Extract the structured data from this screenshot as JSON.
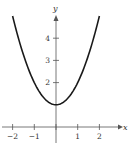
{
  "chart_data": {
    "type": "line",
    "title": "",
    "function": "y = x^2 + 1",
    "xlabel": "x",
    "ylabel": "y",
    "xlim": [
      -2.5,
      3.2
    ],
    "ylim": [
      -0.3,
      5.3
    ],
    "x_ticks": [
      -2,
      -1,
      0,
      1,
      2
    ],
    "x_tick_labels": [
      "−2",
      "−1",
      "",
      "1",
      "2"
    ],
    "y_ticks": [
      2,
      3,
      4
    ],
    "y_tick_labels": [
      "2",
      "3",
      "4"
    ],
    "grid": false,
    "legend": null,
    "series": [
      {
        "name": "y = x^2 + 1",
        "x": [
          -2,
          -1.5,
          -1,
          -0.5,
          0,
          0.5,
          1,
          1.5,
          2
        ],
        "values": [
          5,
          3.25,
          2,
          1.25,
          1,
          1.25,
          2,
          3.25,
          5
        ]
      }
    ],
    "colors": {
      "curve": "#1a1a1a",
      "axes": "#555555"
    }
  }
}
